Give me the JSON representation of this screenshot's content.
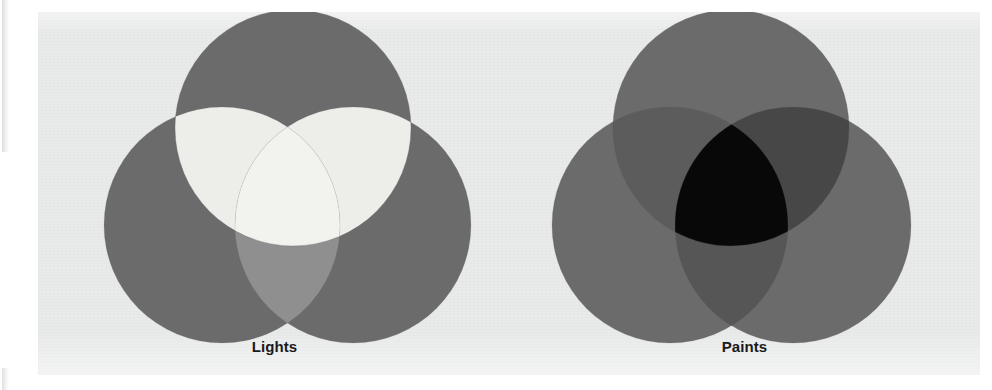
{
  "figure": {
    "background_color": "#ffffff",
    "page_color": "#e9eaea",
    "diagrams": [
      {
        "id": "lights",
        "caption": "Lights",
        "mixing_model": "additive",
        "circle_color": "#6b6b6b",
        "pair_overlap_color": "#ededea",
        "triple_overlap_color": "#f2f2ef",
        "center_result": "white",
        "circles": [
          {
            "name": "top-circle",
            "cx": 255,
            "cy": 116,
            "r": 118
          },
          {
            "name": "left-circle",
            "cx": 184,
            "cy": 213,
            "r": 118
          },
          {
            "name": "right-circle",
            "cx": 315,
            "cy": 213,
            "r": 118
          }
        ]
      },
      {
        "id": "paints",
        "caption": "Paints",
        "mixing_model": "subtractive",
        "circle_color": "#6b6b6b",
        "pair_overlap_color": "#4a4a4a",
        "triple_overlap_color": "#080808",
        "center_result": "black",
        "circles": [
          {
            "name": "top-circle",
            "cx": 222,
            "cy": 116,
            "r": 118
          },
          {
            "name": "left-circle",
            "cx": 161,
            "cy": 213,
            "r": 118
          },
          {
            "name": "right-circle",
            "cx": 284,
            "cy": 213,
            "r": 118
          }
        ]
      }
    ]
  }
}
